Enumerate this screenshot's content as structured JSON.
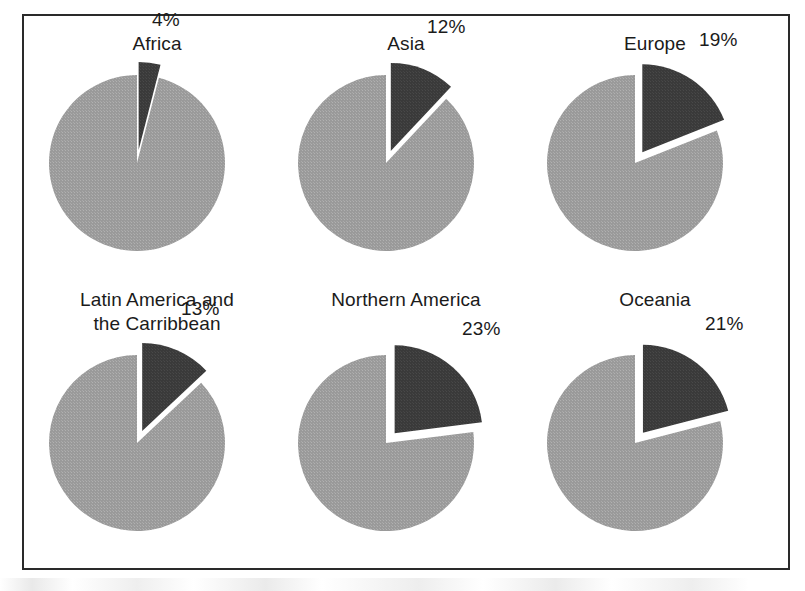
{
  "figure": {
    "frame_color": "#2a2a2a",
    "background": "#ffffff",
    "slice_major_color": "#9a9a9a",
    "slice_highlight_color": "#3a3a3a",
    "gap_color": "#ffffff"
  },
  "chart_data": {
    "type": "pie",
    "title": "",
    "subtitle": "",
    "xlabel": "",
    "ylabel": "",
    "legend": [],
    "grid": false,
    "layout": {
      "rows": 2,
      "cols": 3,
      "panel_order": "row-major"
    },
    "series_note": "Each panel is a single pie with one exploded highlighted wedge labelled with its percentage; the remainder is the unlabelled major slice.",
    "panels": [
      {
        "label": "Africa",
        "label_lines": [
          "Africa"
        ],
        "highlight_pct": 4,
        "highlight_label": "4%",
        "remainder_pct": 96,
        "slices": [
          {
            "name": "highlight",
            "value": 4,
            "color": "#3a3a3a",
            "exploded": true
          },
          {
            "name": "remainder",
            "value": 96,
            "color": "#9a9a9a",
            "exploded": false
          }
        ]
      },
      {
        "label": "Asia",
        "label_lines": [
          "Asia"
        ],
        "highlight_pct": 12,
        "highlight_label": "12%",
        "remainder_pct": 88,
        "slices": [
          {
            "name": "highlight",
            "value": 12,
            "color": "#3a3a3a",
            "exploded": true
          },
          {
            "name": "remainder",
            "value": 88,
            "color": "#9a9a9a",
            "exploded": false
          }
        ]
      },
      {
        "label": "Europe",
        "label_lines": [
          "Europe"
        ],
        "highlight_pct": 19,
        "highlight_label": "19%",
        "remainder_pct": 81,
        "slices": [
          {
            "name": "highlight",
            "value": 19,
            "color": "#3a3a3a",
            "exploded": true
          },
          {
            "name": "remainder",
            "value": 81,
            "color": "#9a9a9a",
            "exploded": false
          }
        ]
      },
      {
        "label": "Latin America and the Carribbean",
        "label_lines": [
          "Latin America and",
          "the Carribbean"
        ],
        "highlight_pct": 13,
        "highlight_label": "13%",
        "remainder_pct": 87,
        "slices": [
          {
            "name": "highlight",
            "value": 13,
            "color": "#3a3a3a",
            "exploded": true
          },
          {
            "name": "remainder",
            "value": 87,
            "color": "#9a9a9a",
            "exploded": false
          }
        ]
      },
      {
        "label": "Northern America",
        "label_lines": [
          "Northern America"
        ],
        "highlight_pct": 23,
        "highlight_label": "23%",
        "remainder_pct": 77,
        "slices": [
          {
            "name": "highlight",
            "value": 23,
            "color": "#3a3a3a",
            "exploded": true
          },
          {
            "name": "remainder",
            "value": 77,
            "color": "#9a9a9a",
            "exploded": false
          }
        ]
      },
      {
        "label": "Oceania",
        "label_lines": [
          "Oceania"
        ],
        "highlight_pct": 21,
        "highlight_label": "21%",
        "remainder_pct": 79,
        "slices": [
          {
            "name": "highlight",
            "value": 21,
            "color": "#3a3a3a",
            "exploded": true
          },
          {
            "name": "remainder",
            "value": 79,
            "color": "#9a9a9a",
            "exploded": false
          }
        ]
      }
    ]
  },
  "panel_titles": {
    "p0": "Africa",
    "p1": "Asia",
    "p2": "Europe",
    "p3": "Latin America and\nthe Carribbean",
    "p4": "Northern America",
    "p5": "Oceania"
  },
  "panel_percent_labels": {
    "p0": "4%",
    "p1": "12%",
    "p2": "19%",
    "p3": "13%",
    "p4": "23%",
    "p5": "21%"
  }
}
